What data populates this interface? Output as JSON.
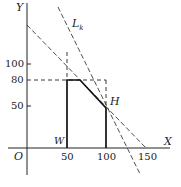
{
  "diagram": {
    "axes": {
      "x_label": "X",
      "y_label": "Y",
      "origin_label": "O",
      "x_ticks": [
        "50",
        "100",
        "150"
      ],
      "y_ticks": [
        "100",
        "80",
        "50"
      ]
    },
    "labels": {
      "line_lk": "L",
      "line_lk_sub": "k",
      "point_h": "H",
      "point_w": "W"
    },
    "colors": {
      "ink": "#222222",
      "background": "#ffffff"
    }
  }
}
